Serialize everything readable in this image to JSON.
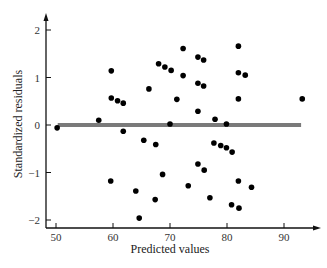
{
  "chart_data": {
    "type": "scatter",
    "title": "",
    "xlabel": "Predicted values",
    "ylabel": "Standardized residuals",
    "xlim": [
      48.3,
      95
    ],
    "ylim": [
      -2.1,
      2.4
    ],
    "xticks": [
      50,
      60,
      70,
      80,
      90
    ],
    "yticks": [
      -2,
      -1,
      0,
      1,
      2
    ],
    "xtick_labels": [
      "50",
      "60",
      "70",
      "80",
      "90"
    ],
    "ytick_labels": [
      "−2",
      "−1",
      "0",
      "1",
      "2"
    ],
    "grid": false,
    "legend": null,
    "reference_line": {
      "y": 0,
      "x_from": 50.3,
      "x_to": 93.0,
      "color": "#7a7a7a"
    },
    "marker_color": "#000000",
    "points": [
      {
        "x": 50.2,
        "y": -0.06
      },
      {
        "x": 57.5,
        "y": 0.1
      },
      {
        "x": 59.7,
        "y": 1.14
      },
      {
        "x": 59.7,
        "y": 0.57
      },
      {
        "x": 60.8,
        "y": 0.51
      },
      {
        "x": 61.8,
        "y": 0.46
      },
      {
        "x": 61.8,
        "y": -0.13
      },
      {
        "x": 59.6,
        "y": -1.18
      },
      {
        "x": 64.0,
        "y": -1.39
      },
      {
        "x": 64.6,
        "y": -1.96
      },
      {
        "x": 65.4,
        "y": -0.32
      },
      {
        "x": 66.3,
        "y": 0.76
      },
      {
        "x": 67.5,
        "y": -0.41
      },
      {
        "x": 67.4,
        "y": -1.57
      },
      {
        "x": 68.0,
        "y": 1.29
      },
      {
        "x": 69.1,
        "y": 1.22
      },
      {
        "x": 68.7,
        "y": -1.04
      },
      {
        "x": 70.2,
        "y": 1.15
      },
      {
        "x": 70.0,
        "y": 0.02
      },
      {
        "x": 71.2,
        "y": 0.54
      },
      {
        "x": 72.3,
        "y": 1.61
      },
      {
        "x": 72.3,
        "y": 1.04
      },
      {
        "x": 73.2,
        "y": -1.28
      },
      {
        "x": 74.9,
        "y": 1.43
      },
      {
        "x": 75.9,
        "y": 1.37
      },
      {
        "x": 74.9,
        "y": 0.88
      },
      {
        "x": 75.9,
        "y": 0.82
      },
      {
        "x": 74.9,
        "y": 0.29
      },
      {
        "x": 74.9,
        "y": -0.82
      },
      {
        "x": 76.0,
        "y": -0.95
      },
      {
        "x": 77.7,
        "y": -0.38
      },
      {
        "x": 78.9,
        "y": -0.43
      },
      {
        "x": 79.9,
        "y": -0.48
      },
      {
        "x": 80.9,
        "y": -0.57
      },
      {
        "x": 77.0,
        "y": -1.53
      },
      {
        "x": 77.9,
        "y": 0.12
      },
      {
        "x": 79.9,
        "y": 0.02
      },
      {
        "x": 80.8,
        "y": -1.68
      },
      {
        "x": 82.0,
        "y": 1.66
      },
      {
        "x": 82.0,
        "y": 1.1
      },
      {
        "x": 83.2,
        "y": 1.05
      },
      {
        "x": 82.0,
        "y": 0.55
      },
      {
        "x": 82.0,
        "y": -1.18
      },
      {
        "x": 82.1,
        "y": -1.75
      },
      {
        "x": 84.3,
        "y": -1.31
      },
      {
        "x": 93.2,
        "y": 0.55
      }
    ]
  }
}
